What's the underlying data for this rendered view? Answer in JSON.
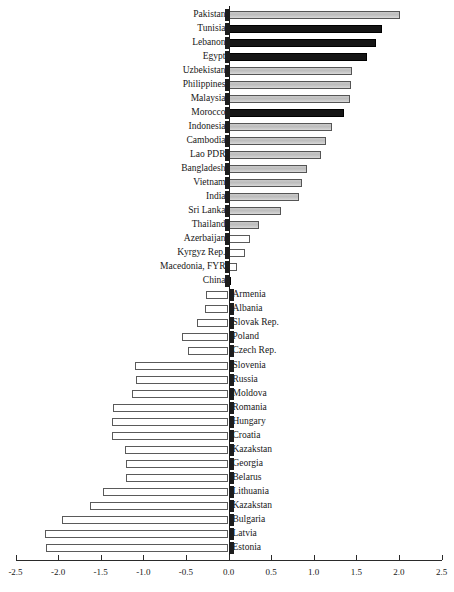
{
  "chart_data": {
    "type": "bar",
    "orientation": "horizontal",
    "title": "",
    "xlabel": "",
    "ylabel": "",
    "xlim": [
      -2.5,
      2.5
    ],
    "xticks": [
      -2.5,
      -2.0,
      -1.5,
      -1.0,
      -0.5,
      0.0,
      0.5,
      1.0,
      1.5,
      2.0,
      2.5
    ],
    "xtick_labels": [
      "-2.5",
      "-2.0",
      "-1.5",
      "-1.0",
      "-0.5",
      "0.0",
      "0.5",
      "1.0",
      "1.5",
      "2.0",
      "2.5"
    ],
    "grid": false,
    "legend": null,
    "categories": [
      "Pakistan",
      "Tunisia",
      "Lebanon",
      "Egypt",
      "Uzbekistan",
      "Philippines",
      "Malaysia",
      "Morocco",
      "Indonesia",
      "Cambodia",
      "Lao PDR",
      "Bangladesh",
      "Vietnam",
      "India",
      "Sri Lanka",
      "Thailand",
      "Azerbaijan",
      "Kyrgyz Rep.",
      "Macedonia, FYR",
      "China",
      "Armenia",
      "Albania",
      "Slovak Rep.",
      "Poland",
      "Czech Rep.",
      "Slovenia",
      "Russia",
      "Moldova",
      "Romania",
      "Hungary",
      "Croatia",
      "Kazakstan",
      "Georgia",
      "Belarus",
      "Lithuania",
      "Kazakstan",
      "Bulgaria",
      "Latvia",
      "Estonia"
    ],
    "values": [
      2.01,
      1.8,
      1.73,
      1.62,
      1.45,
      1.44,
      1.43,
      1.35,
      1.22,
      1.14,
      1.08,
      0.92,
      0.86,
      0.83,
      0.62,
      0.36,
      0.25,
      0.19,
      0.1,
      0.03,
      -0.26,
      -0.27,
      -0.37,
      -0.55,
      -0.48,
      -1.1,
      -1.08,
      -1.13,
      -1.35,
      -1.37,
      -1.37,
      -1.22,
      -1.2,
      -1.2,
      -1.47,
      -1.62,
      -1.95,
      -2.15,
      -2.14
    ],
    "bar_styles": [
      "gray",
      "black",
      "black",
      "black",
      "gray",
      "gray",
      "gray",
      "black",
      "gray",
      "gray",
      "gray",
      "gray",
      "gray",
      "gray",
      "gray",
      "gray",
      "white",
      "white",
      "white",
      "black",
      "white",
      "white",
      "white",
      "white",
      "white",
      "white",
      "white",
      "white",
      "white",
      "white",
      "white",
      "white",
      "white",
      "white",
      "white",
      "white",
      "white",
      "white",
      "white"
    ],
    "colors": {
      "black_fill": "#151515",
      "gray_fill": "#c4c4c4",
      "white_fill": "#ffffff",
      "bar_outline": "#4a4a4a",
      "axis": "#2a2a2a"
    }
  }
}
